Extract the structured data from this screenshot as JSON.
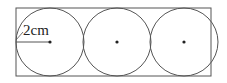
{
  "diagram": {
    "type": "geometry",
    "radius_label": "2cm",
    "stroke_color": "#555555",
    "rectangle": {
      "x": 16,
      "y": 8,
      "width": 195,
      "height": 68
    },
    "circles": [
      {
        "cx": 50,
        "cy": 42,
        "r": 34
      },
      {
        "cx": 117,
        "cy": 42,
        "r": 34
      },
      {
        "cx": 184,
        "cy": 42,
        "r": 34
      }
    ]
  }
}
